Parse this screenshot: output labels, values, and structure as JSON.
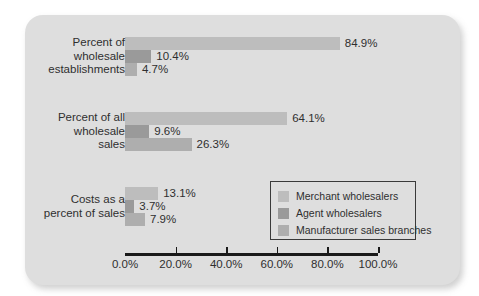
{
  "chart_data": {
    "type": "bar",
    "orientation": "horizontal",
    "title": "",
    "xlabel": "",
    "ylabel": "",
    "xlim": [
      0,
      100
    ],
    "grid": false,
    "legend_position": "bottom-right",
    "categories": [
      "Percent of wholesale establishments",
      "Percent of all wholesale sales",
      "Costs as a percent of sales"
    ],
    "category_lines": [
      [
        "Percent of",
        "wholesale",
        "establishments"
      ],
      [
        "Percent of all",
        "wholesale",
        "sales"
      ],
      [
        "Costs as a",
        "percent of sales"
      ]
    ],
    "series": [
      {
        "name": "Merchant wholesalers",
        "color": "#bdbdbd",
        "values": [
          84.9,
          64.1,
          13.1
        ],
        "labels": [
          "84.9%",
          "64.1%",
          "13.1%"
        ]
      },
      {
        "name": "Agent wholesalers",
        "color": "#9a9a9a",
        "values": [
          10.4,
          9.6,
          3.7
        ],
        "labels": [
          "10.4%",
          "9.6%",
          "3.7%"
        ]
      },
      {
        "name": "Manufacturer sales branches",
        "color": "#aeaeae",
        "values": [
          4.7,
          26.3,
          7.9
        ],
        "labels": [
          "4.7%",
          "26.3%",
          "7.9%"
        ]
      }
    ],
    "xticks": [
      0,
      20,
      40,
      60,
      80,
      100
    ],
    "xtick_labels": [
      "0.0%",
      "20.0%",
      "40.0%",
      "60.0%",
      "80.0%",
      "100.0%"
    ]
  },
  "legend": {
    "items": [
      {
        "label": "Merchant wholesalers",
        "color": "#bdbdbd"
      },
      {
        "label": "Agent wholesalers",
        "color": "#9a9a9a"
      },
      {
        "label": "Manufacturer sales branches",
        "color": "#aeaeae"
      }
    ]
  },
  "colors": {
    "card_background": "#dedede",
    "page_background": "#ffffff",
    "text": "#2f2f2f",
    "axis": "#1a1a1a"
  }
}
